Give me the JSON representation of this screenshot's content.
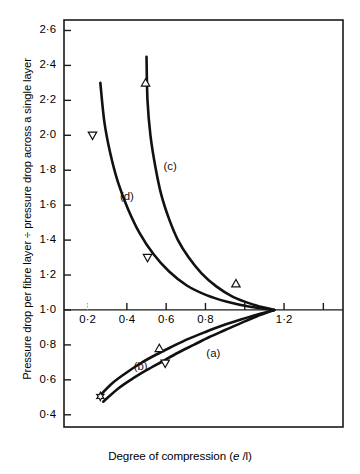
{
  "chart_data": {
    "type": "line",
    "title": "",
    "xlabel": "Degree of compression (e /l)",
    "ylabel": "Pressure drop per fibre layer ÷ pressure drop across a single layer",
    "xlim": [
      0.08,
      1.5
    ],
    "ylim": [
      0.33,
      2.66
    ],
    "grid": false,
    "legend": "inline-curve-labels",
    "xticks": [
      0.2,
      0.4,
      0.6,
      0.8,
      1.0,
      1.2,
      1.4
    ],
    "xticklabels": [
      "0·2",
      "0·4",
      "0·6",
      "0·8",
      "",
      "1·2",
      ""
    ],
    "yticks": [
      0.4,
      0.6,
      0.8,
      1.0,
      1.2,
      1.4,
      1.6,
      1.8,
      2.0,
      2.2,
      2.4,
      2.6
    ],
    "yticklabels": [
      "0·4",
      "0·6",
      "0·8",
      "1·0",
      "1·2",
      "1·4",
      "1·6",
      "1·8",
      "2·0",
      "2·2",
      "2·4",
      "2·6"
    ],
    "convergence_point": [
      1.15,
      1.0
    ],
    "series": [
      {
        "name": "(a)",
        "label": "(a)",
        "label_position": [
          0.84,
          0.73
        ],
        "points": [
          [
            0.28,
            0.475
          ],
          [
            0.35,
            0.545
          ],
          [
            0.42,
            0.6
          ],
          [
            0.5,
            0.655
          ],
          [
            0.58,
            0.705
          ],
          [
            0.66,
            0.755
          ],
          [
            0.74,
            0.8
          ],
          [
            0.82,
            0.845
          ],
          [
            0.9,
            0.885
          ],
          [
            0.98,
            0.925
          ],
          [
            1.06,
            0.963
          ],
          [
            1.15,
            1.0
          ]
        ]
      },
      {
        "name": "(b)",
        "label": "(b)",
        "label_position": [
          0.47,
          0.655
        ],
        "points": [
          [
            0.255,
            0.5
          ],
          [
            0.32,
            0.575
          ],
          [
            0.39,
            0.635
          ],
          [
            0.47,
            0.695
          ],
          [
            0.55,
            0.745
          ],
          [
            0.63,
            0.79
          ],
          [
            0.71,
            0.833
          ],
          [
            0.8,
            0.874
          ],
          [
            0.89,
            0.912
          ],
          [
            0.98,
            0.945
          ],
          [
            1.07,
            0.975
          ],
          [
            1.15,
            1.0
          ]
        ]
      },
      {
        "name": "(c)",
        "label": "(c)",
        "label_position": [
          0.62,
          1.8
        ],
        "points": [
          [
            0.5,
            2.45
          ],
          [
            0.505,
            2.2
          ],
          [
            0.52,
            2.0
          ],
          [
            0.545,
            1.82
          ],
          [
            0.575,
            1.66
          ],
          [
            0.615,
            1.52
          ],
          [
            0.66,
            1.4
          ],
          [
            0.715,
            1.3
          ],
          [
            0.78,
            1.21
          ],
          [
            0.855,
            1.135
          ],
          [
            0.94,
            1.075
          ],
          [
            1.04,
            1.032
          ],
          [
            1.15,
            1.0
          ]
        ]
      },
      {
        "name": "(d)",
        "label": "(d)",
        "label_position": [
          0.4,
          1.63
        ],
        "points": [
          [
            0.265,
            2.3
          ],
          [
            0.285,
            2.08
          ],
          [
            0.315,
            1.9
          ],
          [
            0.355,
            1.73
          ],
          [
            0.405,
            1.58
          ],
          [
            0.465,
            1.44
          ],
          [
            0.535,
            1.32
          ],
          [
            0.615,
            1.22
          ],
          [
            0.705,
            1.14
          ],
          [
            0.805,
            1.085
          ],
          [
            0.91,
            1.047
          ],
          [
            1.02,
            1.02
          ],
          [
            1.15,
            1.0
          ]
        ]
      }
    ],
    "markers": [
      {
        "shape": "triangle-down",
        "x": 0.225,
        "y": 2.0,
        "series": "(d)"
      },
      {
        "shape": "triangle-up",
        "x": 0.495,
        "y": 2.3,
        "series": "(c)"
      },
      {
        "shape": "triangle-down",
        "x": 0.505,
        "y": 1.3,
        "series": "(d)"
      },
      {
        "shape": "triangle-up",
        "x": 0.955,
        "y": 1.15,
        "series": "(c)"
      },
      {
        "shape": "triangle-up",
        "x": 0.565,
        "y": 0.78,
        "series": "(a)"
      },
      {
        "shape": "triangle-down",
        "x": 0.595,
        "y": 0.695,
        "series": "(b)"
      },
      {
        "shape": "star",
        "x": 0.265,
        "y": 0.505,
        "series": "(b)"
      }
    ]
  },
  "axis": {
    "y_title": "Pressure drop per fibre layer ÷ pressure drop across a single layer",
    "x_title_pre": "Degree of compression (",
    "x_title_italic": "e",
    "x_title_post": " /l)"
  }
}
